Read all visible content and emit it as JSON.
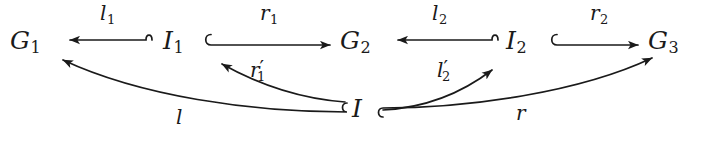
{
  "diagram": {
    "type": "commutative-diagram",
    "stroke_color": "#1a1a1a",
    "background_color": "#ffffff",
    "nodes": [
      {
        "id": "G1",
        "base": "G",
        "sub": "1",
        "x": 10,
        "y": 28
      },
      {
        "id": "I1",
        "base": "I",
        "sub": "1",
        "x": 163,
        "y": 28
      },
      {
        "id": "G2",
        "base": "G",
        "sub": "2",
        "x": 340,
        "y": 28
      },
      {
        "id": "I2",
        "base": "I",
        "sub": "2",
        "x": 506,
        "y": 28
      },
      {
        "id": "G3",
        "base": "G",
        "sub": "3",
        "x": 648,
        "y": 28
      },
      {
        "id": "I",
        "base": "I",
        "sub": "",
        "x": 352,
        "y": 96
      }
    ],
    "arrows": [
      {
        "id": "l1",
        "from": "I1",
        "to": "G1",
        "base": "l",
        "sub": "1",
        "prime": false,
        "label_x": 100,
        "label_y": 3,
        "style": "hooked-tail-left"
      },
      {
        "id": "r1",
        "from": "I1",
        "to": "G2",
        "base": "r",
        "sub": "1",
        "prime": false,
        "label_x": 260,
        "label_y": 3,
        "style": "hooked-tail-right"
      },
      {
        "id": "l2",
        "from": "I2",
        "to": "G2",
        "base": "l",
        "sub": "2",
        "prime": false,
        "label_x": 432,
        "label_y": 3,
        "style": "hooked-tail-left"
      },
      {
        "id": "r2",
        "from": "I2",
        "to": "G3",
        "base": "r",
        "sub": "2",
        "prime": false,
        "label_x": 590,
        "label_y": 3,
        "style": "hooked-tail-right"
      },
      {
        "id": "r1p",
        "from": "I",
        "to": "I1",
        "base": "r",
        "sub": "1",
        "prime": true,
        "label_x": 250,
        "label_y": 58,
        "style": "curved"
      },
      {
        "id": "l2p",
        "from": "I",
        "to": "I2",
        "base": "l",
        "sub": "2",
        "prime": true,
        "label_x": 437,
        "label_y": 58,
        "style": "curved"
      },
      {
        "id": "l",
        "from": "I",
        "to": "G1",
        "base": "l",
        "sub": "",
        "prime": false,
        "label_x": 176,
        "label_y": 107,
        "style": "curved-hooked"
      },
      {
        "id": "r",
        "from": "I",
        "to": "G3",
        "base": "r",
        "sub": "",
        "prime": false,
        "label_x": 516,
        "label_y": 103,
        "style": "curved-hooked"
      }
    ]
  }
}
